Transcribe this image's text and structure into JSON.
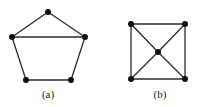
{
  "figure": {
    "background_color": "#ffffff",
    "edge_color": "#2b2b2b",
    "vertex_color": "#111111",
    "caption_color": "#1a1a1a",
    "edge_width": 1.3,
    "vertex_radius": 3.0
  },
  "panels": [
    {
      "id": "a",
      "caption": "(a)",
      "name": "pentagon-graph",
      "vertex_count": 5,
      "edge_count": 6,
      "vertices": [
        {
          "id": "a-top",
          "x": 48,
          "y": 12
        },
        {
          "id": "a-left",
          "x": 12,
          "y": 37
        },
        {
          "id": "a-right",
          "x": 85,
          "y": 37
        },
        {
          "id": "a-bottom-left",
          "x": 26,
          "y": 80
        },
        {
          "id": "a-bottom-right",
          "x": 71,
          "y": 80
        }
      ],
      "edges": [
        {
          "from": "a-top",
          "to": "a-left"
        },
        {
          "from": "a-top",
          "to": "a-right"
        },
        {
          "from": "a-left",
          "to": "a-right"
        },
        {
          "from": "a-left",
          "to": "a-bottom-left"
        },
        {
          "from": "a-right",
          "to": "a-bottom-right"
        },
        {
          "from": "a-bottom-left",
          "to": "a-bottom-right"
        }
      ]
    },
    {
      "id": "b",
      "caption": "(b)",
      "name": "square-with-center-graph",
      "vertex_count": 5,
      "edge_count": 8,
      "vertices": [
        {
          "id": "b-top-left",
          "x": 131,
          "y": 24
        },
        {
          "id": "b-top-right",
          "x": 185,
          "y": 24
        },
        {
          "id": "b-center",
          "x": 158,
          "y": 52
        },
        {
          "id": "b-bottom-left",
          "x": 131,
          "y": 79
        },
        {
          "id": "b-bottom-right",
          "x": 185,
          "y": 79
        }
      ],
      "edges": [
        {
          "from": "b-top-left",
          "to": "b-top-right"
        },
        {
          "from": "b-top-right",
          "to": "b-bottom-right"
        },
        {
          "from": "b-bottom-right",
          "to": "b-bottom-left"
        },
        {
          "from": "b-bottom-left",
          "to": "b-top-left"
        },
        {
          "from": "b-top-left",
          "to": "b-center"
        },
        {
          "from": "b-top-right",
          "to": "b-center"
        },
        {
          "from": "b-bottom-left",
          "to": "b-center"
        },
        {
          "from": "b-bottom-right",
          "to": "b-center"
        }
      ]
    }
  ]
}
